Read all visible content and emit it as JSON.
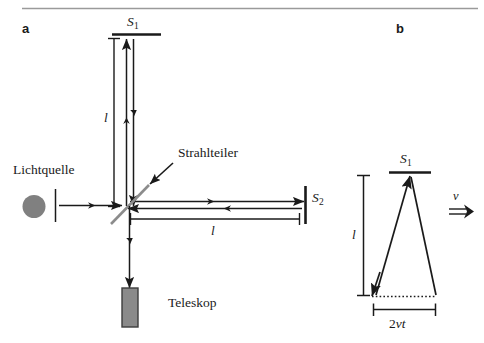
{
  "figure": {
    "panels": [
      {
        "letter": "a",
        "name": "michelson-interferometer-schematic",
        "labels": {
          "mirror_top": "S",
          "mirror_top_sub": "1",
          "mirror_right": "S",
          "mirror_right_sub": "2",
          "beam_splitter": "Strahlteiler",
          "light_source": "Lichtquelle",
          "telescope": "Teleskop",
          "arm_vertical_length": "l",
          "arm_horizontal_length": "l"
        }
      },
      {
        "letter": "b",
        "name": "light-path-moving-frame",
        "labels": {
          "mirror_top": "S",
          "mirror_top_sub": "1",
          "height": "l",
          "base": "2vt",
          "base_prefix": "2",
          "base_italic": "vt",
          "velocity": "v"
        }
      }
    ],
    "colors": {
      "ink": "#1a1a1a",
      "rule": "#9a9a9a",
      "beam_splitter": "#8c8c8c",
      "light_source": "#808080",
      "telescope_fill": "#8a8a8a",
      "telescope_stroke": "#3d3d3d"
    }
  }
}
